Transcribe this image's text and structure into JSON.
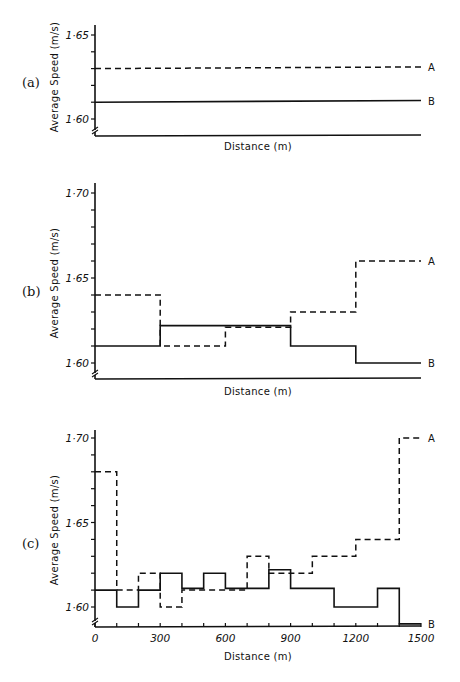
{
  "chart_data": [
    {
      "id": "a",
      "type": "line",
      "panel_label": "(a)",
      "title": "",
      "xlabel": "Distance (m)",
      "ylabel": "Average Speed (m/s)",
      "xlim": [
        0,
        1500
      ],
      "ylim": [
        1.59,
        1.655
      ],
      "yticks": [
        1.6,
        1.61,
        1.62,
        1.63,
        1.64,
        1.65
      ],
      "ytick_labels": [
        "1·60",
        "",
        "",
        "",
        "",
        "1·65"
      ],
      "xticks": [],
      "xtick_labels": [],
      "grid": false,
      "axis_break": true,
      "legend": "inline-right",
      "series": [
        {
          "name": "A",
          "style": "dashed",
          "x": [
            0,
            1500
          ],
          "values": [
            1.63,
            1.631
          ]
        },
        {
          "name": "B",
          "style": "solid",
          "x": [
            0,
            1500
          ],
          "values": [
            1.61,
            1.611
          ]
        }
      ]
    },
    {
      "id": "b",
      "type": "line",
      "step": true,
      "panel_label": "(b)",
      "title": "",
      "xlabel": "Distance (m)",
      "ylabel": "Average Speed (m/s)",
      "xlim": [
        0,
        1500
      ],
      "ylim": [
        1.59,
        1.705
      ],
      "yticks": [
        1.6,
        1.61,
        1.62,
        1.63,
        1.64,
        1.65,
        1.66,
        1.67,
        1.68,
        1.69,
        1.7
      ],
      "ytick_labels": [
        "1·60",
        "",
        "",
        "",
        "",
        "1·65",
        "",
        "",
        "",
        "",
        "1·70"
      ],
      "xticks": [],
      "xtick_labels": [],
      "grid": false,
      "axis_break": true,
      "legend": "inline-right",
      "segment_edges": [
        0,
        300,
        600,
        900,
        1200,
        1500
      ],
      "series": [
        {
          "name": "A",
          "style": "dashed",
          "values": [
            1.64,
            1.61,
            1.621,
            1.63,
            1.66
          ]
        },
        {
          "name": "B",
          "style": "solid",
          "values": [
            1.61,
            1.622,
            1.622,
            1.61,
            1.6
          ]
        }
      ]
    },
    {
      "id": "c",
      "type": "line",
      "step": true,
      "panel_label": "(c)",
      "title": "",
      "xlabel": "Distance (m)",
      "ylabel": "Average Speed (m/s)",
      "xlim": [
        0,
        1500
      ],
      "ylim": [
        1.585,
        1.705
      ],
      "yticks": [
        1.6,
        1.61,
        1.62,
        1.63,
        1.64,
        1.65,
        1.66,
        1.67,
        1.68,
        1.69,
        1.7
      ],
      "ytick_labels": [
        "1·60",
        "",
        "",
        "",
        "",
        "1·65",
        "",
        "",
        "",
        "",
        "1·70"
      ],
      "xticks": [
        0,
        100,
        200,
        300,
        400,
        500,
        600,
        700,
        800,
        900,
        1000,
        1100,
        1200,
        1300,
        1400,
        1500
      ],
      "xtick_labels": [
        "0",
        "",
        "",
        "300",
        "",
        "",
        "600",
        "",
        "",
        "900",
        "",
        "",
        "1200",
        "",
        "",
        "1500"
      ],
      "grid": false,
      "axis_break": true,
      "legend": "inline-right",
      "segment_edges": [
        0,
        100,
        200,
        300,
        400,
        500,
        600,
        700,
        800,
        900,
        1000,
        1100,
        1200,
        1300,
        1400,
        1500
      ],
      "series": [
        {
          "name": "A",
          "style": "dashed",
          "values": [
            1.68,
            1.61,
            1.62,
            1.6,
            1.61,
            1.61,
            1.61,
            1.63,
            1.62,
            1.62,
            1.63,
            1.63,
            1.64,
            1.64,
            1.7
          ]
        },
        {
          "name": "B",
          "style": "solid",
          "values": [
            1.61,
            1.6,
            1.61,
            1.62,
            1.611,
            1.62,
            1.611,
            1.611,
            1.622,
            1.611,
            1.611,
            1.6,
            1.6,
            1.611,
            1.59
          ]
        }
      ]
    }
  ],
  "layout": {
    "panels": [
      {
        "id": "a",
        "x0": 95,
        "x1": 421,
        "y_at_160": 119,
        "px_per_001": 16.8,
        "axis_top": 25,
        "xaxis_y": 136,
        "label_y": 87,
        "xlabel_y": 150
      },
      {
        "id": "b",
        "x0": 95,
        "x1": 421,
        "y_at_160": 363,
        "px_per_001": 17.0,
        "axis_top": 183,
        "xaxis_y": 379,
        "label_y": 296,
        "xlabel_y": 395
      },
      {
        "id": "c",
        "x0": 95,
        "x1": 421,
        "y_at_160": 607,
        "px_per_001": 16.9,
        "axis_top": 430,
        "xaxis_y": 627,
        "label_y": 548,
        "xlabel_y": 660
      }
    ],
    "colors": {
      "ink": "#111111",
      "background": "#ffffff"
    }
  }
}
